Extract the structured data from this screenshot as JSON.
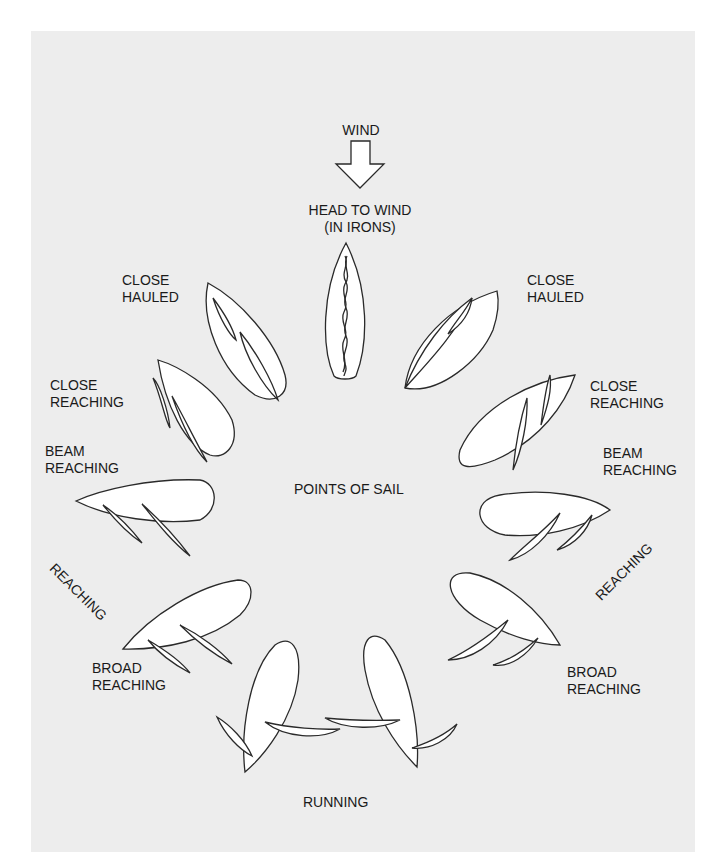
{
  "title": "POINTS OF SAIL",
  "wind_label": "WIND",
  "labels": {
    "head_to_wind": "HEAD TO WIND\n(IN IRONS)",
    "close_hauled_left": "CLOSE\nHAULED",
    "close_hauled_right": "CLOSE\nHAULED",
    "close_reaching_left": "CLOSE\nREACHING",
    "close_reaching_right": "CLOSE\nREACHING",
    "beam_reaching_left": "BEAM\nREACHING",
    "beam_reaching_right": "BEAM\nREACHING",
    "reaching_left": "REACHING",
    "reaching_right": "REACHING",
    "broad_reaching_left": "BROAD\nREACHING",
    "broad_reaching_right": "BROAD\nREACHING",
    "running": "RUNNING"
  },
  "colors": {
    "panel_background": "#ededed",
    "page_background": "#ffffff",
    "outline": "#2a2a2a",
    "fill": "#ffffff"
  }
}
